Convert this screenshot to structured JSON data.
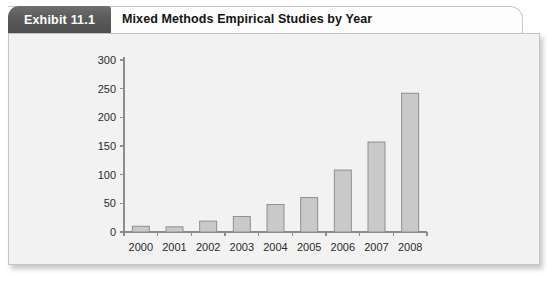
{
  "exhibit": {
    "number_label": "Exhibit 11.1",
    "title": "Mixed Methods Empirical Studies by Year"
  },
  "chart_data": {
    "type": "bar",
    "title": "Mixed Methods Empirical Studies by Year",
    "xlabel": "",
    "ylabel": "",
    "categories": [
      "2000",
      "2001",
      "2002",
      "2003",
      "2004",
      "2005",
      "2006",
      "2007",
      "2008"
    ],
    "values": [
      10,
      9,
      19,
      27,
      48,
      60,
      108,
      157,
      242
    ],
    "ylim": [
      0,
      300
    ],
    "yticks": [
      0,
      50,
      100,
      150,
      200,
      250,
      300
    ],
    "ytick_labels": [
      "0",
      "50",
      "100",
      "150",
      "200",
      "250",
      "300"
    ],
    "grid": false,
    "legend": false,
    "bar_color": "#c9c9c9",
    "bar_border_color": "#8f8f8f",
    "axis_color": "#8c8c8c",
    "plot_background": "#f2f2f2"
  },
  "colors": {
    "tab_background": "#5b5b5b",
    "tab_text": "#ffffff",
    "title_text": "#141414",
    "panel_background": "#f2f2f2",
    "panel_border": "#c4c4c4"
  }
}
